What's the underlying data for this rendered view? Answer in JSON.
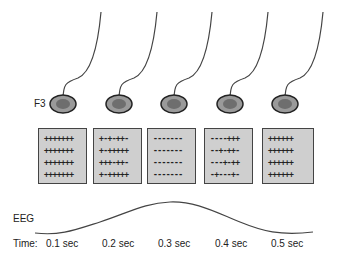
{
  "electrode_label": "F3",
  "electrodes": [
    {
      "cx": 63,
      "cy": 104
    },
    {
      "cx": 119,
      "cy": 104
    },
    {
      "cx": 174,
      "cy": 104
    },
    {
      "cx": 230,
      "cy": 104
    },
    {
      "cx": 285,
      "cy": 104
    }
  ],
  "charge_boxes": [
    {
      "rows": [
        "+++++++",
        "+++++++",
        "+++++++",
        "+++++++"
      ]
    },
    {
      "rows": [
        "+-+-++-",
        "+-+++++",
        "+++-++-",
        "+-+++++"
      ]
    },
    {
      "rows": [
        "-------",
        "-------",
        "-------",
        "-------"
      ]
    },
    {
      "rows": [
        "----+++",
        "--+-++-",
        "---+-++",
        "-+---+-"
      ]
    },
    {
      "rows": [
        "++++++",
        "++++++",
        "++++++",
        "++++++"
      ]
    }
  ],
  "eeg_label": "EEG",
  "time_label": "Time:",
  "times": [
    "0.1 sec",
    "0.2 sec",
    "0.3 sec",
    "0.4 sec",
    "0.5 sec"
  ],
  "colors": {
    "electrode_outer": "#9a9a9a",
    "electrode_inner": "#6e6e6e",
    "box_fill": "#cfcfcf",
    "line": "#444444"
  }
}
